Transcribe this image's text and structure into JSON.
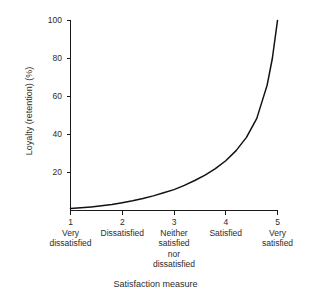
{
  "chart_data": {
    "type": "line",
    "title": "",
    "xlabel": "Satisfaction measure",
    "ylabel": "Loyalty (retention) (%)",
    "xlim": [
      1,
      5
    ],
    "ylim": [
      0,
      100
    ],
    "grid": false,
    "legend": "none",
    "x_ticks": [
      {
        "value": 1,
        "label": "1",
        "category": "Very\ndissatisfied"
      },
      {
        "value": 2,
        "label": "2",
        "category": "Dissatisfied"
      },
      {
        "value": 3,
        "label": "3",
        "category": "Neither\nsatisfied\nnor\ndissatisfied"
      },
      {
        "value": 4,
        "label": "4",
        "category": "Satisfied"
      },
      {
        "value": 5,
        "label": "5",
        "category": "Very\nsatisfied"
      }
    ],
    "y_ticks": [
      {
        "value": 20,
        "label": "20"
      },
      {
        "value": 40,
        "label": "40"
      },
      {
        "value": 60,
        "label": "60"
      },
      {
        "value": 80,
        "label": "80"
      },
      {
        "value": 100,
        "label": "100"
      }
    ],
    "series": [
      {
        "name": "Loyalty vs satisfaction",
        "color": "#111111",
        "x": [
          1.0,
          1.2,
          1.4,
          1.6,
          1.8,
          2.0,
          2.2,
          2.4,
          2.6,
          2.8,
          3.0,
          3.2,
          3.4,
          3.6,
          3.8,
          4.0,
          4.2,
          4.4,
          4.6,
          4.8,
          4.9,
          5.0
        ],
        "values": [
          1.0,
          1.4,
          1.9,
          2.5,
          3.2,
          4.1,
          5.1,
          6.3,
          7.7,
          9.3,
          11.0,
          13.2,
          15.8,
          18.6,
          22.0,
          26.2,
          31.5,
          38.5,
          48.5,
          66.0,
          80.0,
          100.0
        ]
      }
    ]
  },
  "axis_titles": {
    "y": "Loyalty (retention) (%)",
    "x": "Satisfaction measure"
  },
  "colors": {
    "curve": "#111111",
    "axis": "#1a1a1a",
    "text": "#2b2b2b",
    "background": "#ffffff"
  }
}
